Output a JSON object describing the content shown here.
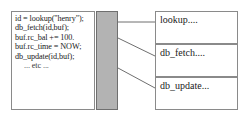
{
  "diagram": {
    "code_box": {
      "name": "application-code",
      "lines": [
        {
          "text": "id = lookup(\"henry\");",
          "indented": false
        },
        {
          "text": "db_fetch(id,buf);",
          "indented": false
        },
        {
          "text": "buf.rc_bal += 100.",
          "indented": false
        },
        {
          "text": "buf.rc_time = NOW;",
          "indented": false
        },
        {
          "text": "db_update(id,buf);",
          "indented": false
        },
        {
          "text": "... etc ...",
          "indented": true
        }
      ]
    },
    "library_bar": {
      "name": "library-boundary",
      "color": "#b3b3b3",
      "border_color": "#6f6f6f"
    },
    "routines": [
      {
        "label": "lookup...."
      },
      {
        "label": "db_fetch...."
      },
      {
        "label": "db_update..."
      }
    ],
    "connectors": [
      {
        "from": "library-bar",
        "to": "lookup",
        "x1": 118,
        "y1": 22,
        "x2": 155,
        "y2": 22
      },
      {
        "from": "library-bar",
        "to": "db_fetch",
        "x1": 118,
        "y1": 38,
        "x2": 155,
        "y2": 56
      },
      {
        "from": "library-bar",
        "to": "db_update",
        "x1": 118,
        "y1": 68,
        "x2": 155,
        "y2": 88
      }
    ],
    "colors": {
      "background": "#ffffff",
      "box_border": "#8a8a8a",
      "text": "#1b1b1b",
      "line": "#6f6f6f"
    }
  }
}
